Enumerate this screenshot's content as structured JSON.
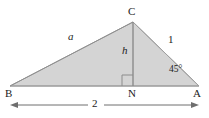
{
  "figure": {
    "kind": "geometry-diagram",
    "colors": {
      "background": "#ffffff",
      "triangle_fill": "#d4d4d4",
      "triangle_stroke": "#9a9a9a",
      "altitude_stroke": "#8c8c8c",
      "right_angle_stroke": "#8c8c8c",
      "dimension_stroke": "#6e6e6e",
      "label_text": "#1c1c1c"
    },
    "vertices": [
      {
        "id": "B",
        "label": "B",
        "x": 10,
        "y": 86,
        "label_x": 6,
        "label_y": 89
      },
      {
        "id": "C",
        "label": "C",
        "x": 133,
        "y": 22,
        "label_x": 129,
        "label_y": 7
      },
      {
        "id": "A",
        "label": "A",
        "x": 199,
        "y": 86,
        "label_x": 194,
        "label_y": 89
      },
      {
        "id": "N",
        "label": "N",
        "x": 133,
        "y": 86,
        "label_x": 129,
        "label_y": 89
      }
    ],
    "side_labels": [
      {
        "id": "side-bc",
        "text": "a",
        "x": 68,
        "y": 32,
        "style": "italic"
      },
      {
        "id": "side-ca",
        "text": "1",
        "x": 168,
        "y": 34,
        "style": "upright"
      },
      {
        "id": "altitude",
        "text": "h",
        "x": 122,
        "y": 46,
        "style": "italic"
      }
    ],
    "angle_labels": [
      {
        "id": "angle-a",
        "text": "45°",
        "x": 170,
        "y": 66
      }
    ],
    "right_angle_marker": {
      "id": "right-angle-n",
      "at_vertex": "N",
      "size": 11
    },
    "dimension": {
      "id": "dimension-ba",
      "text": "2",
      "from_x": 10,
      "to_x": 199,
      "y": 105,
      "label_x": 94,
      "label_y": 99,
      "gap_left": 88,
      "gap_right": 104
    }
  }
}
